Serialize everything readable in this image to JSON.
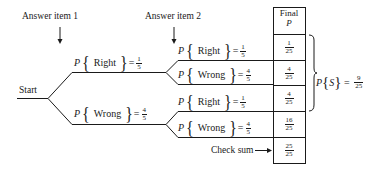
{
  "labels": {
    "answer_item_1": "Answer item 1",
    "answer_item_2": "Answer item 2",
    "start": "Start",
    "check_sum": "Check sum"
  },
  "branches": {
    "level1": [
      {
        "outcome": "Right",
        "p_symbol": "P",
        "num": "1",
        "den": "5"
      },
      {
        "outcome": "Wrong",
        "p_symbol": "P",
        "num": "4",
        "den": "5"
      }
    ],
    "level2": [
      {
        "outcome": "Right",
        "p_symbol": "P",
        "num": "1",
        "den": "5"
      },
      {
        "outcome": "Wrong",
        "p_symbol": "P",
        "num": "4",
        "den": "5"
      },
      {
        "outcome": "Right",
        "p_symbol": "P",
        "num": "1",
        "den": "5"
      },
      {
        "outcome": "Wrong",
        "p_symbol": "P",
        "num": "4",
        "den": "5"
      }
    ]
  },
  "table": {
    "header_line1": "Final",
    "header_line2": "P",
    "rows": [
      {
        "num": "1",
        "den": "25"
      },
      {
        "num": "4",
        "den": "25"
      },
      {
        "num": "4",
        "den": "25"
      },
      {
        "num": "16",
        "den": "25"
      }
    ],
    "check_sum": {
      "num": "25",
      "den": "25"
    }
  },
  "success": {
    "p_symbol": "P",
    "event": "S",
    "num": "9",
    "den": "25"
  }
}
